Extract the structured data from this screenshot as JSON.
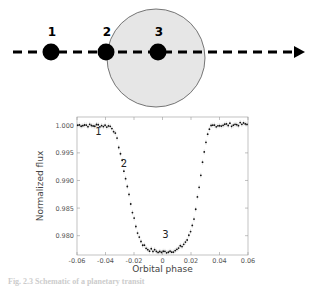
{
  "diagram": {
    "labels": [
      "1",
      "2",
      "3"
    ],
    "positions": [
      {
        "label": "1",
        "x": 51,
        "y": 52
      },
      {
        "label": "2",
        "x": 106,
        "y": 52
      },
      {
        "label": "3",
        "x": 158,
        "y": 52
      }
    ],
    "star": {
      "cx": 156,
      "cy": 58,
      "r": 49,
      "fill": "#e6e6e6"
    },
    "path": {
      "y": 52,
      "x_start": 13,
      "x_end": 303
    }
  },
  "chart_data": {
    "type": "scatter",
    "title": "",
    "xlabel": "Orbital phase",
    "ylabel": "Normalized flux",
    "xlim": [
      -0.06,
      0.06
    ],
    "ylim": [
      0.9765,
      1.0015
    ],
    "xticks": [
      "-0.06",
      "-0.04",
      "-0.02",
      "0",
      "0.02",
      "0.04",
      "0.06"
    ],
    "yticks": [
      "1.000",
      "0.995",
      "0.990",
      "0.985",
      "0.980"
    ],
    "grid": false,
    "annotations": [
      {
        "text": "1",
        "x": -0.045,
        "y": 0.9983
      },
      {
        "text": "2",
        "x": -0.027,
        "y": 0.9925
      },
      {
        "text": "3",
        "x": 0.002,
        "y": 0.9795
      }
    ],
    "series": [
      {
        "name": "transit light curve",
        "x": [
          -0.06,
          -0.055,
          -0.05,
          -0.045,
          -0.04,
          -0.036,
          -0.034,
          -0.032,
          -0.03,
          -0.028,
          -0.026,
          -0.024,
          -0.022,
          -0.02,
          -0.018,
          -0.016,
          -0.014,
          -0.012,
          -0.01,
          -0.005,
          0,
          0.005,
          0.01,
          0.012,
          0.014,
          0.016,
          0.018,
          0.02,
          0.022,
          0.024,
          0.026,
          0.028,
          0.03,
          0.032,
          0.034,
          0.036,
          0.04,
          0.045,
          0.05,
          0.055,
          0.06
        ],
        "y": [
          1.0,
          1.0001,
          0.9999,
          1.0,
          0.9999,
          0.9998,
          0.999,
          0.9975,
          0.9955,
          0.993,
          0.9905,
          0.988,
          0.9855,
          0.983,
          0.981,
          0.9795,
          0.9785,
          0.9779,
          0.9775,
          0.9772,
          0.977,
          0.9772,
          0.9774,
          0.9778,
          0.9782,
          0.9788,
          0.9795,
          0.981,
          0.983,
          0.986,
          0.9895,
          0.993,
          0.996,
          0.9985,
          0.9998,
          1.0,
          1.0,
          1.0001,
          1.0001,
          1.0002,
          1.0002
        ]
      }
    ]
  },
  "caption": "Fig. 2.3 Schematic of a planetary transit"
}
